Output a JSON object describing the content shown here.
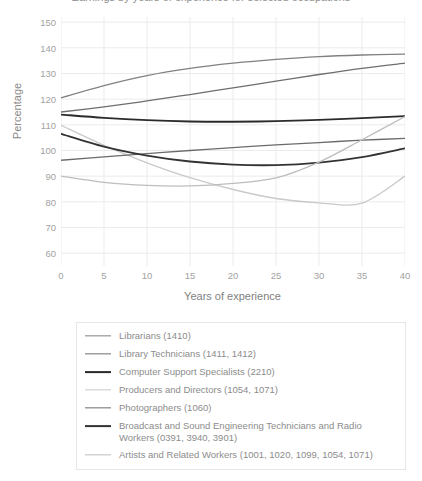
{
  "chart_data": {
    "type": "line",
    "title": "Earnings by years of experience for selected occupations",
    "xlabel": "Years of experience",
    "ylabel": "Percentage",
    "xlim": [
      0,
      40
    ],
    "ylim": [
      55,
      152
    ],
    "xticks": [
      0,
      5,
      10,
      15,
      20,
      25,
      30,
      35,
      40
    ],
    "yticks": [
      60,
      70,
      80,
      90,
      100,
      110,
      120,
      130,
      140,
      150
    ],
    "grid": true,
    "legend_position": "below",
    "x": [
      0,
      5,
      10,
      15,
      20,
      25,
      30,
      35,
      40
    ],
    "series": [
      {
        "name": "Librarians (1410)",
        "code": "1410",
        "color": "#808080",
        "width": 1.3,
        "values": [
          120.5,
          125.3,
          129.2,
          132.0,
          134.0,
          135.5,
          136.6,
          137.2,
          137.5
        ]
      },
      {
        "name": "Library Technicians (1411, 1412)",
        "code": "1411, 1412",
        "color": "#6e6e6e",
        "width": 1.3,
        "values": [
          115.0,
          117.0,
          119.3,
          121.8,
          124.4,
          127.0,
          129.6,
          132.0,
          134.0
        ]
      },
      {
        "name": "Computer Support Specialists (2210)",
        "code": "2210",
        "color": "#2b2b2b",
        "width": 1.8,
        "values": [
          114.0,
          112.7,
          111.8,
          111.3,
          111.2,
          111.4,
          111.9,
          112.6,
          113.4
        ]
      },
      {
        "name": "Producers and Directors (1054, 1071)",
        "code": "1054, 1071",
        "color": "#c9c9c9",
        "width": 1.3,
        "values": [
          109.8,
          102.0,
          95.2,
          89.4,
          84.8,
          81.3,
          79.6,
          79.5,
          90.0
        ]
      },
      {
        "name": "Photographers (1060)",
        "code": "1060",
        "color": "#6b6b6b",
        "width": 1.3,
        "values": [
          96.2,
          97.5,
          98.8,
          100.0,
          101.1,
          102.2,
          103.1,
          104.0,
          104.7
        ]
      },
      {
        "name": "Broadcast and Sound Engineering Technicians and Radio Workers (0391, 3940, 3901)",
        "code": "0391, 3940, 3901",
        "color": "#333333",
        "width": 1.8,
        "values": [
          106.5,
          101.5,
          98.0,
          95.7,
          94.5,
          94.3,
          95.3,
          97.4,
          100.8
        ]
      },
      {
        "name": "Artists and Related Workers (1001, 1020, 1099, 1054, 1071)",
        "code": "1001, 1020, 1099, 1054, 1071",
        "color": "#bdbdbd",
        "width": 1.3,
        "values": [
          90.0,
          87.6,
          86.4,
          86.2,
          87.2,
          89.3,
          95.5,
          104.2,
          113.2
        ]
      }
    ]
  },
  "legend": {
    "items": [
      {
        "label": "Librarians (1410)"
      },
      {
        "label": "Library Technicians (1411, 1412)"
      },
      {
        "label": "Computer Support Specialists (2210)"
      },
      {
        "label": "Producers and Directors (1054, 1071)"
      },
      {
        "label": "Photographers (1060)"
      },
      {
        "label": "Broadcast and Sound Engineering Technicians and Radio Workers (0391, 3940, 3901)"
      },
      {
        "label": "Artists and Related Workers (1001, 1020, 1099, 1054, 1071)"
      }
    ]
  },
  "axes": {
    "y_title": "Percentage",
    "x_title": "Years of experience"
  }
}
